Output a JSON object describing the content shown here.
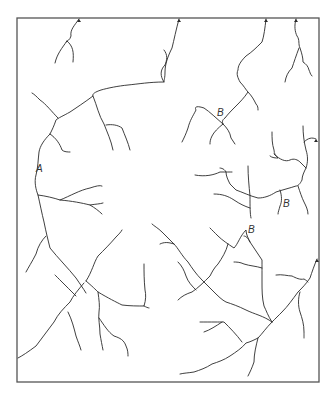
{
  "diagram": {
    "type": "drainage-pattern-line-drawing",
    "stroke_color": "#2a2a2a",
    "frame_color": "#555555",
    "background": "#ffffff",
    "labels": [
      {
        "id": "A",
        "text": "A",
        "x": 39,
        "y": 172
      },
      {
        "id": "B1",
        "text": "B",
        "x": 217,
        "y": 117
      },
      {
        "id": "B2",
        "text": "B",
        "x": 282,
        "y": 208
      },
      {
        "id": "B3",
        "text": "B",
        "x": 247,
        "y": 234
      }
    ],
    "outlet_arrows": [
      {
        "x": 79,
        "y": 19
      },
      {
        "x": 179,
        "y": 19
      },
      {
        "x": 266,
        "y": 19
      },
      {
        "x": 296,
        "y": 19
      },
      {
        "x": 316,
        "y": 139
      },
      {
        "x": 317,
        "y": 259
      }
    ]
  }
}
